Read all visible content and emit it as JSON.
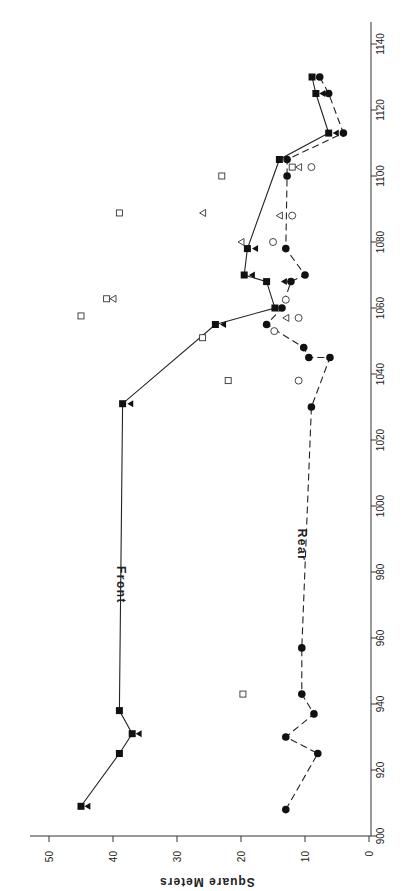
{
  "chart_data": {
    "type": "scatter",
    "title": "",
    "orientation": "rotated-90 (year axis vertical on right, value axis horizontal at bottom, labels rotated)",
    "xlabel": "",
    "ylabel": "Square Meters",
    "xlim": [
      900,
      1140
    ],
    "ylim": [
      0,
      50
    ],
    "x_ticks": [
      900,
      920,
      940,
      960,
      980,
      1000,
      1020,
      1040,
      1060,
      1080,
      1100,
      1120,
      1140
    ],
    "y_ticks": [
      0,
      10,
      20,
      30,
      40,
      50
    ],
    "grid": false,
    "legend": "none (inline labels)",
    "annotations": [
      {
        "text": "Front",
        "x": 975,
        "y": 40
      },
      {
        "text": "Rear",
        "x": 985,
        "y": 11
      }
    ],
    "series": [
      {
        "name": "Front",
        "style": "solid line, filled squares",
        "points": [
          {
            "x": 909,
            "y": 45
          },
          {
            "x": 925,
            "y": 39
          },
          {
            "x": 931,
            "y": 37
          },
          {
            "x": 938,
            "y": 39
          },
          {
            "x": 1031,
            "y": 38.5
          },
          {
            "x": 1055,
            "y": 24
          },
          {
            "x": 1060,
            "y": 14.7
          },
          {
            "x": 1068,
            "y": 16
          },
          {
            "x": 1070,
            "y": 19.5
          },
          {
            "x": 1078,
            "y": 19
          },
          {
            "x": 1105,
            "y": 14
          },
          {
            "x": 1113,
            "y": 6.3
          },
          {
            "x": 1125,
            "y": 8.3
          },
          {
            "x": 1130,
            "y": 8.9
          }
        ]
      },
      {
        "name": "Rear",
        "style": "dashed line, filled circles",
        "points": [
          {
            "x": 908,
            "y": 13
          },
          {
            "x": 925,
            "y": 8
          },
          {
            "x": 930,
            "y": 13
          },
          {
            "x": 937,
            "y": 8.6
          },
          {
            "x": 943,
            "y": 10.5
          },
          {
            "x": 957,
            "y": 10.5
          },
          {
            "x": 1030,
            "y": 9
          },
          {
            "x": 1045,
            "y": 6.1
          },
          {
            "x": 1045,
            "y": 9.4
          },
          {
            "x": 1048,
            "y": 10.2
          },
          {
            "x": 1055,
            "y": 16
          },
          {
            "x": 1060,
            "y": 13.6
          },
          {
            "x": 1068,
            "y": 12.2
          },
          {
            "x": 1070,
            "y": 10
          },
          {
            "x": 1078,
            "y": 13
          },
          {
            "x": 1100,
            "y": 12.8
          },
          {
            "x": 1105,
            "y": 12.8
          },
          {
            "x": 1113,
            "y": 4
          },
          {
            "x": 1125,
            "y": 6.3
          },
          {
            "x": 1130,
            "y": 7.7
          }
        ]
      },
      {
        "name": "Filled triangles",
        "style": "filled left-pointing triangles, no line",
        "points": [
          {
            "x": 909,
            "y": 44
          },
          {
            "x": 931,
            "y": 36
          },
          {
            "x": 1031,
            "y": 37.3
          },
          {
            "x": 1055,
            "y": 22.8
          },
          {
            "x": 1068,
            "y": 13.3
          },
          {
            "x": 1070,
            "y": 18.3
          },
          {
            "x": 1078,
            "y": 17.8
          },
          {
            "x": 1113,
            "y": 5.2
          },
          {
            "x": 1125,
            "y": 7.3
          }
        ]
      },
      {
        "name": "Open squares",
        "style": "open squares, no line",
        "points": [
          {
            "x": 943,
            "y": 19.7
          },
          {
            "x": 1038,
            "y": 22
          },
          {
            "x": 1051,
            "y": 26
          },
          {
            "x": 1057.6,
            "y": 45
          },
          {
            "x": 1062.8,
            "y": 41
          },
          {
            "x": 1088.8,
            "y": 39
          },
          {
            "x": 1100,
            "y": 23
          },
          {
            "x": 1102.7,
            "y": 12
          }
        ]
      },
      {
        "name": "Open triangles",
        "style": "open left-pointing triangles, no line",
        "points": [
          {
            "x": 1057,
            "y": 13
          },
          {
            "x": 1062.8,
            "y": 40
          },
          {
            "x": 1080,
            "y": 20
          },
          {
            "x": 1088,
            "y": 14
          },
          {
            "x": 1088.8,
            "y": 26
          },
          {
            "x": 1102.7,
            "y": 11
          }
        ]
      },
      {
        "name": "Open circles",
        "style": "open circles, no line",
        "points": [
          {
            "x": 1038,
            "y": 11
          },
          {
            "x": 1053,
            "y": 14.8
          },
          {
            "x": 1057,
            "y": 11
          },
          {
            "x": 1062.5,
            "y": 13
          },
          {
            "x": 1080,
            "y": 15
          },
          {
            "x": 1088,
            "y": 12
          },
          {
            "x": 1102.7,
            "y": 9
          }
        ]
      }
    ]
  },
  "labels": {
    "ylabel": "Square Meters",
    "front": "Front",
    "rear": "Rear"
  }
}
